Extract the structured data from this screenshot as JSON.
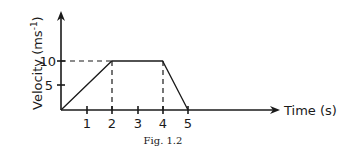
{
  "chart_data": {
    "type": "line",
    "title": "",
    "caption": "Fig. 1.2",
    "xlabel": "Time (s)",
    "ylabel": "Velocity (ms-1)",
    "ylabel_main": "Velocity (ms",
    "ylabel_sup": "-1",
    "ylabel_close": ")",
    "x_ticks": [
      1,
      2,
      3,
      4,
      5
    ],
    "x_tick_labels": [
      "1",
      "2",
      "3",
      "4",
      "5"
    ],
    "y_ticks": [
      5,
      10
    ],
    "y_tick_labels": [
      "5",
      "10"
    ],
    "series": [
      {
        "name": "velocity",
        "x": [
          0,
          2,
          4,
          5
        ],
        "y": [
          0,
          10,
          10,
          0
        ]
      }
    ],
    "reference_lines": [
      {
        "type": "horizontal-dashed",
        "y": 10,
        "from_x": 0,
        "to_x": 2
      },
      {
        "type": "vertical-dashed",
        "x": 2,
        "from_y": 0,
        "to_y": 10
      },
      {
        "type": "vertical-dashed",
        "x": 4,
        "from_y": 0,
        "to_y": 10
      }
    ],
    "xlim": [
      0,
      5.5
    ],
    "ylim": [
      0,
      14
    ],
    "grid": false,
    "legend": "none"
  }
}
